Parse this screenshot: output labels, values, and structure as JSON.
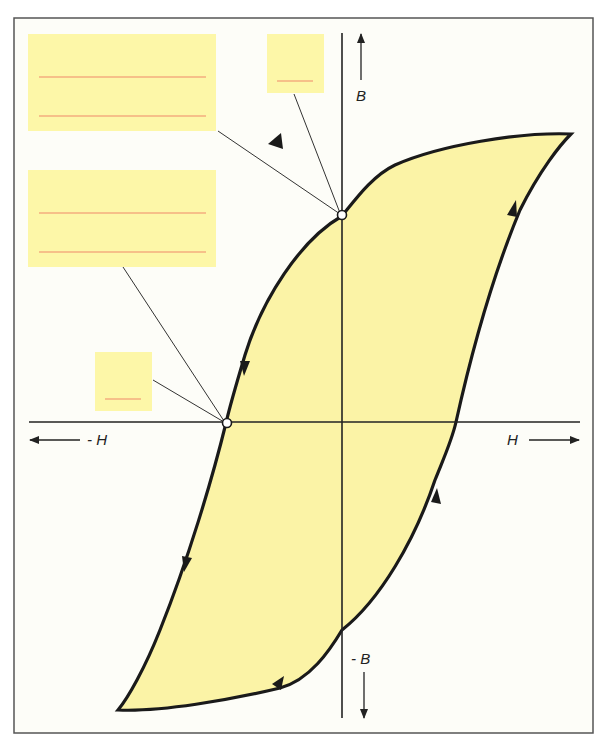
{
  "diagram": {
    "type": "hysteresis-loop",
    "colors": {
      "background": "#fdfdf8",
      "frame": "#555555",
      "loop_fill": "#fbf3a6",
      "loop_stroke": "#1a1a1a",
      "axis": "#222222",
      "label_box_fill": "#fdf7a8",
      "placeholder_line": "#f08a6a",
      "leader_line": "#333333"
    },
    "axes": {
      "h_positive": "H",
      "h_negative": "- H",
      "b_positive": "B",
      "b_negative": "- B"
    },
    "label_boxes": [
      {
        "id": "box-top-left-large",
        "lines": 2,
        "points_to": "remanence-point"
      },
      {
        "id": "box-top-small",
        "lines": 1,
        "points_to": "remanence-point"
      },
      {
        "id": "box-mid-left-large",
        "lines": 2,
        "points_to": "coercivity-point"
      },
      {
        "id": "box-lower-small",
        "lines": 1,
        "points_to": "coercivity-point"
      }
    ],
    "marked_points": [
      {
        "id": "remanence-point",
        "on_axis": "B"
      },
      {
        "id": "coercivity-point",
        "on_axis": "-H"
      }
    ],
    "direction_arrows": 6
  }
}
